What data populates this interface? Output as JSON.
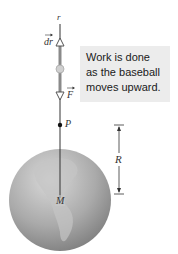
{
  "figure": {
    "caption_box": {
      "lines": [
        "Work is done",
        "as the baseball",
        "moves upward."
      ]
    },
    "labels": {
      "r": "r",
      "dr": "dr",
      "F": "F",
      "P": "P",
      "M": "M",
      "R": "R"
    },
    "colors": {
      "earth": "#a9a9a9",
      "earth_highlight": "#d6d6d6",
      "callout_bg": "#ececec",
      "axis_line": "#333333",
      "ball": "#c8c8c8"
    }
  }
}
